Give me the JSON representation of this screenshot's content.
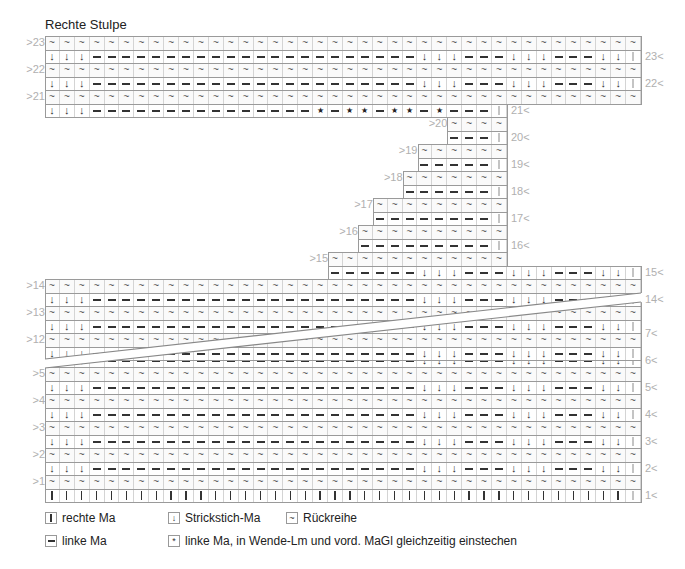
{
  "title": "Rechte Stulpe",
  "grid": {
    "left": 45,
    "col_width": 14.9,
    "row_height": 13.5,
    "columns": 40
  },
  "symbols": {
    "K": "rechte Ma",
    "P": "linke Ma",
    "A": "Strickstich-Ma",
    "W": "Rückreihe",
    "S": "linke Ma, in Wende-Lm und vord. MaGl gleichzeitig einstechen"
  },
  "glyphs": {
    "A": "↓",
    "W": "~",
    "S": "*"
  },
  "rows": [
    {
      "label": ">23",
      "side": "left",
      "top": 36,
      "from": 1,
      "to": 40,
      "pattern": "WS"
    },
    {
      "label": "23<",
      "side": "right",
      "top": 49.5,
      "from": 1,
      "to": 40,
      "pattern": "RS"
    },
    {
      "label": ">22",
      "side": "left",
      "top": 63,
      "from": 1,
      "to": 40,
      "pattern": "WS"
    },
    {
      "label": "22<",
      "side": "right",
      "top": 76.5,
      "from": 1,
      "to": 40,
      "pattern": "RS"
    },
    {
      "label": ">21",
      "side": "left",
      "top": 90,
      "from": 1,
      "to": 40,
      "pattern": "WS"
    },
    {
      "label": "21<",
      "side": "right",
      "top": 103.5,
      "from": 1,
      "to": 31,
      "pattern": "R21"
    },
    {
      "label": ">20",
      "side": "left",
      "top": 117,
      "from": 28,
      "to": 31,
      "pattern": "WS"
    },
    {
      "label": "20<",
      "side": "right",
      "top": 130.5,
      "from": 28,
      "to": 31,
      "pattern": "SHORT"
    },
    {
      "label": ">19",
      "side": "left",
      "top": 144,
      "from": 26,
      "to": 31,
      "pattern": "WS"
    },
    {
      "label": "19<",
      "side": "right",
      "top": 157.5,
      "from": 26,
      "to": 31,
      "pattern": "SHORT"
    },
    {
      "label": ">18",
      "side": "left",
      "top": 171,
      "from": 25,
      "to": 31,
      "pattern": "WS"
    },
    {
      "label": "18<",
      "side": "right",
      "top": 184.5,
      "from": 25,
      "to": 31,
      "pattern": "SHORT"
    },
    {
      "label": ">17",
      "side": "left",
      "top": 198,
      "from": 23,
      "to": 31,
      "pattern": "WS"
    },
    {
      "label": "17<",
      "side": "right",
      "top": 211.5,
      "from": 23,
      "to": 31,
      "pattern": "SHORT"
    },
    {
      "label": ">16",
      "side": "left",
      "top": 225,
      "from": 22,
      "to": 31,
      "pattern": "WS"
    },
    {
      "label": "16<",
      "side": "right",
      "top": 238.5,
      "from": 22,
      "to": 31,
      "pattern": "SHORT"
    },
    {
      "label": ">15",
      "side": "left",
      "top": 252,
      "from": 20,
      "to": 31,
      "pattern": "WS"
    },
    {
      "label": "15<",
      "side": "right",
      "top": 265.5,
      "from": 20,
      "to": 40,
      "pattern": "RS"
    },
    {
      "label": ">14",
      "side": "left",
      "top": 279,
      "from": 1,
      "to": 40,
      "pattern": "WS"
    },
    {
      "label": "14<",
      "side": "right",
      "top": 292.5,
      "from": 1,
      "to": 40,
      "pattern": "RS"
    },
    {
      "label": ">13",
      "side": "left",
      "top": 306,
      "from": 1,
      "to": 40,
      "pattern": "WS"
    },
    {
      "label": "",
      "side": "right",
      "top": 319.5,
      "from": 1,
      "to": 40,
      "pattern": "RS"
    },
    {
      "label": ">12",
      "side": "left",
      "top": 333,
      "from": 1,
      "to": 40,
      "pattern": "WS"
    },
    {
      "label": "",
      "side": "right",
      "top": 346.5,
      "from": 1,
      "to": 40,
      "pattern": "RS"
    },
    {
      "label": "",
      "side": "left",
      "top": 313,
      "from": 1,
      "to": 40,
      "pattern": "WS",
      "lower": true
    },
    {
      "label": "7<",
      "side": "right",
      "top": 326.5,
      "from": 1,
      "to": 40,
      "pattern": "RS",
      "lower": true
    },
    {
      "label": "",
      "side": "left",
      "top": 340,
      "from": 1,
      "to": 40,
      "pattern": "WS",
      "lower": true
    },
    {
      "label": "6<",
      "side": "right",
      "top": 353.5,
      "from": 1,
      "to": 40,
      "pattern": "RS",
      "lower": true
    },
    {
      "label": ">5",
      "side": "left",
      "top": 367,
      "from": 1,
      "to": 40,
      "pattern": "WS",
      "lower": true
    },
    {
      "label": "5<",
      "side": "right",
      "top": 380.5,
      "from": 1,
      "to": 40,
      "pattern": "RS",
      "lower": true
    },
    {
      "label": ">4",
      "side": "left",
      "top": 394,
      "from": 1,
      "to": 40,
      "pattern": "WS",
      "lower": true
    },
    {
      "label": "4<",
      "side": "right",
      "top": 407.5,
      "from": 1,
      "to": 40,
      "pattern": "RS",
      "lower": true
    },
    {
      "label": ">3",
      "side": "left",
      "top": 421,
      "from": 1,
      "to": 40,
      "pattern": "WS",
      "lower": true
    },
    {
      "label": "3<",
      "side": "right",
      "top": 434.5,
      "from": 1,
      "to": 40,
      "pattern": "RS",
      "lower": true
    },
    {
      "label": ">2",
      "side": "left",
      "top": 448,
      "from": 1,
      "to": 40,
      "pattern": "WS",
      "lower": true
    },
    {
      "label": "2<",
      "side": "right",
      "top": 461.5,
      "from": 1,
      "to": 40,
      "pattern": "RS",
      "lower": true
    },
    {
      "label": ">1",
      "side": "left",
      "top": 475,
      "from": 1,
      "to": 40,
      "pattern": "WS",
      "lower": true
    },
    {
      "label": "1<",
      "side": "right",
      "top": 488.5,
      "from": 1,
      "to": 40,
      "pattern": "KNIT",
      "lower": true
    }
  ],
  "patterns": {
    "RS_full": "AAAPPPPPPPPPPPPPPPPPPPPPPAAAPPPAAAPPPAAK",
    "R21": "AAAPPPPPPPPPPPPPPPSPSSPSSPSPPPK",
    "note": "RS pattern columns 1-40; WS rows are all Rückreihe (~), edge stitch light"
  },
  "wedge": {
    "upper_cut": [
      [
        45,
        359
      ],
      [
        641,
        293
      ]
    ],
    "lower_cut": [
      [
        45,
        368
      ],
      [
        641,
        302
      ]
    ]
  },
  "legend": [
    {
      "symbol": "knit",
      "label": "rechte Ma"
    },
    {
      "symbol": "arrow",
      "glyph": "↓",
      "label": "Strickstich-Ma"
    },
    {
      "symbol": "tilde",
      "glyph": "~",
      "label": "Rückreihe"
    },
    {
      "symbol": "dash",
      "label": "linke Ma"
    },
    {
      "symbol": "star",
      "glyph": "*",
      "label": "linke Ma, in Wende-Lm und vord. MaGl gleichzeitig einstechen"
    }
  ]
}
